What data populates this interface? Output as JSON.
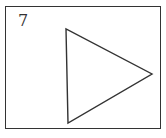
{
  "figure": {
    "label": "7",
    "shape": "triangle-pointing-right",
    "stroke_color": "#333333",
    "background_color": "#ffffff"
  }
}
